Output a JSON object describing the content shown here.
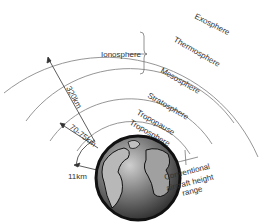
{
  "diagram": {
    "layers": [
      {
        "label": "Exosphere"
      },
      {
        "label": "Thermosphere"
      },
      {
        "label": "Mesosphere"
      },
      {
        "label": "Stratosphere"
      },
      {
        "label": "Tropopause"
      },
      {
        "label": "Troposphere"
      }
    ],
    "ionosphere_label": "Ionosphere",
    "measurements": {
      "ionosphere_height": "320km",
      "stratosphere_height": "70-75km",
      "troposphere_height": "11km"
    },
    "aircraft_label": {
      "line1": "Conventional",
      "line2": "aircraft height",
      "line3": "range"
    },
    "colors": {
      "line": "#888888",
      "text": "#333333",
      "earth_ocean": "#555555",
      "earth_land": "#aaaaaa"
    }
  }
}
